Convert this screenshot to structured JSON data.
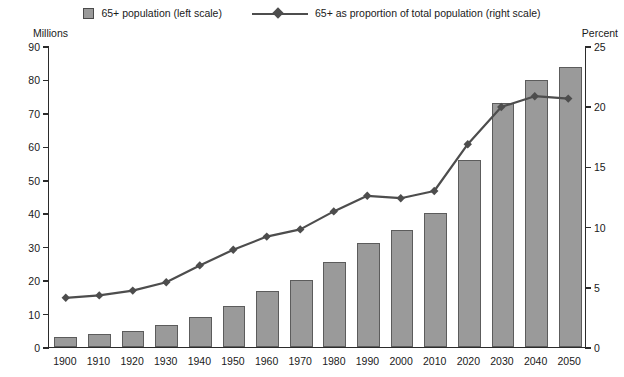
{
  "legend": {
    "items": [
      {
        "label": "65+ population (left scale)",
        "marker": "square-swatch",
        "color": "#9a9a9a"
      },
      {
        "label": "65+ as proportion of total population (right scale)",
        "marker": "diamond-line",
        "color": "#4d4d4d"
      }
    ]
  },
  "axis_captions": {
    "left": "Millions",
    "right": "Percent"
  },
  "chart_data": {
    "type": "bar",
    "title": "",
    "subtitle": "",
    "xlabel": "",
    "ylabel": "Millions",
    "y2label": "Percent",
    "ylim": [
      0,
      90
    ],
    "y2lim": [
      0,
      25
    ],
    "yticks": [
      0,
      10,
      20,
      30,
      40,
      50,
      60,
      70,
      80,
      90
    ],
    "y2ticks": [
      0,
      5,
      10,
      15,
      20,
      25
    ],
    "grid": false,
    "legend_position": "top",
    "categories": [
      "1900",
      "1910",
      "1920",
      "1930",
      "1940",
      "1950",
      "1960",
      "1970",
      "1980",
      "1990",
      "2000",
      "2010",
      "2020",
      "2030",
      "2040",
      "2050"
    ],
    "series": [
      {
        "name": "65+ population (left scale)",
        "type": "bar",
        "axis": "left",
        "unit": "millions",
        "color": "#9a9a9a",
        "values": [
          3.1,
          3.9,
          4.9,
          6.6,
          9.0,
          12.3,
          16.7,
          20.1,
          25.5,
          31.2,
          35.0,
          40.2,
          56.0,
          73.0,
          79.7,
          83.7
        ]
      },
      {
        "name": "65+ as proportion of total population (right scale)",
        "type": "line",
        "axis": "right",
        "unit": "percent",
        "color": "#4d4d4d",
        "values": [
          4.1,
          4.3,
          4.7,
          5.4,
          6.8,
          8.1,
          9.2,
          9.8,
          11.3,
          12.6,
          12.4,
          13.0,
          16.9,
          20.0,
          20.9,
          20.7
        ]
      }
    ]
  }
}
